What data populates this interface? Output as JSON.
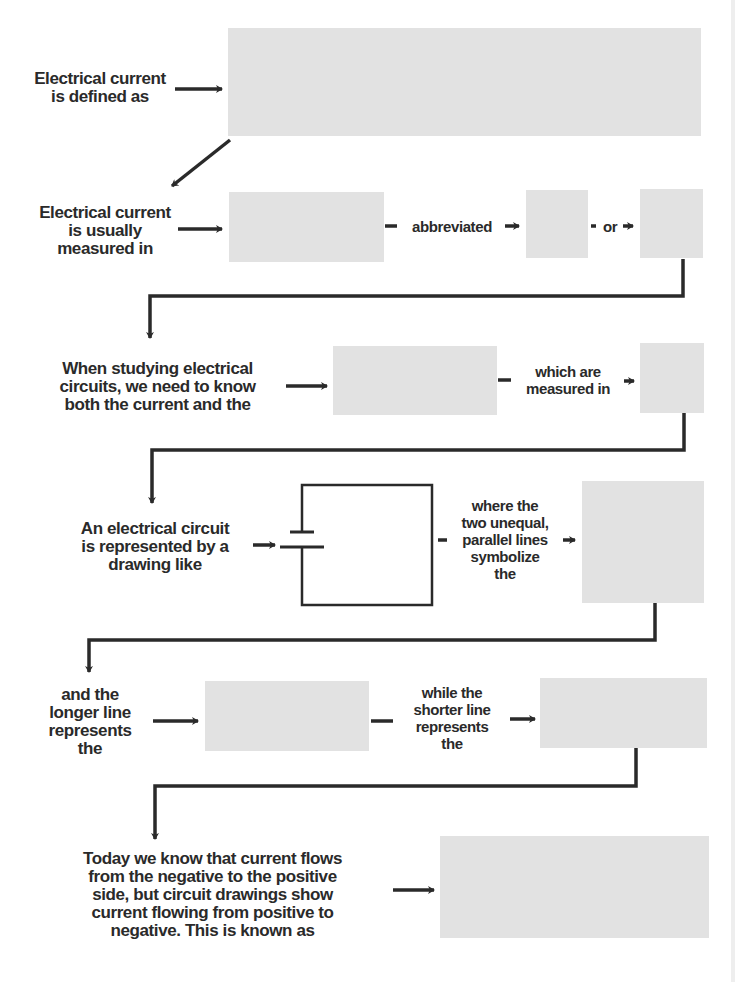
{
  "diagram": {
    "type": "flowchart-worksheet",
    "colors": {
      "text": "#2a2a2a",
      "answer_box": "#e2e2e2",
      "line": "#2a2a2a",
      "background": "#ffffff"
    },
    "steps": [
      {
        "id": "s1",
        "prompt": "Electrical current is defined as",
        "lines": [
          "Electrical current",
          "is defined as"
        ],
        "answer": ""
      },
      {
        "id": "s2",
        "prompt": "Electrical current is usually measured in",
        "lines": [
          "Electrical current",
          "is usually",
          "measured in"
        ],
        "answer": "",
        "connector_1": "abbreviated",
        "answer_2": "",
        "connector_2": "or",
        "answer_3": ""
      },
      {
        "id": "s3",
        "prompt": "When studying electrical circuits, we need to know both the current and the",
        "lines": [
          "When studying electrical",
          "circuits, we need to know",
          "both the current and the"
        ],
        "answer": "",
        "connector_lines": [
          "which are",
          "measured in"
        ],
        "answer_2": ""
      },
      {
        "id": "s4",
        "prompt": "An electrical circuit is represented by a drawing like",
        "lines": [
          "An electrical circuit",
          "is represented by a",
          "drawing like"
        ],
        "figure": "circuit-diagram-battery",
        "connector_lines": [
          "where the",
          "two unequal,",
          "parallel lines",
          "symbolize",
          "the"
        ],
        "answer": ""
      },
      {
        "id": "s5",
        "prompt": "and the longer line represents the",
        "lines": [
          "and the",
          "longer line",
          "represents",
          "the"
        ],
        "answer": "",
        "connector_lines": [
          "while the",
          "shorter line",
          "represents",
          "the"
        ],
        "answer_2": ""
      },
      {
        "id": "s6",
        "prompt": "Today we know that current flows from the negative to the positive side, but circuit drawings show current flowing from positive to negative. This is known as",
        "lines": [
          "Today we know that current flows",
          "from the negative to the positive",
          "side, but circuit drawings show",
          "current flowing from positive to",
          "negative. This is known as"
        ],
        "answer": ""
      }
    ]
  }
}
